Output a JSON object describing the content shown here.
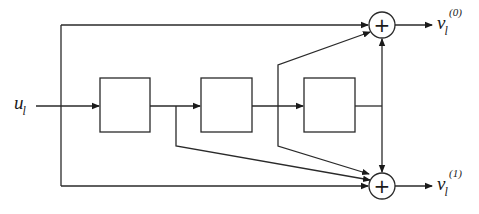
{
  "diagram": {
    "type": "convolutional-encoder",
    "input": {
      "symbol": "u",
      "subscript": "l"
    },
    "delay_blocks": [
      {
        "id": "D1",
        "label": ""
      },
      {
        "id": "D2",
        "label": ""
      },
      {
        "id": "D3",
        "label": ""
      }
    ],
    "adders": [
      {
        "id": "adder-top",
        "symbol": "+"
      },
      {
        "id": "adder-bottom",
        "symbol": "+"
      }
    ],
    "outputs": [
      {
        "symbol": "v",
        "subscript": "l",
        "superscript": "(0)"
      },
      {
        "symbol": "v",
        "subscript": "l",
        "superscript": "(1)"
      }
    ],
    "connections": {
      "adder-top": [
        "input",
        "after-D2",
        "after-D3"
      ],
      "adder-bottom": [
        "input",
        "after-D1",
        "after-D2",
        "after-D3"
      ]
    },
    "colors": {
      "line": "#2a2a2a",
      "background": "#ffffff"
    }
  }
}
